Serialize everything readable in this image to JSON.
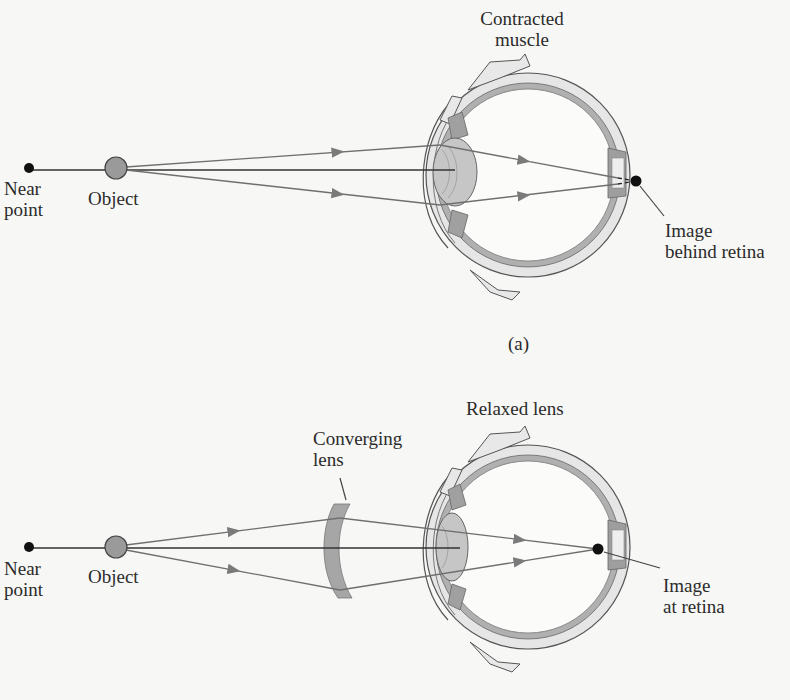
{
  "panel_a": {
    "caption": "(a)",
    "top_label_line1": "Contracted",
    "top_label_line2": "muscle",
    "near_point_line1": "Near",
    "near_point_line2": "point",
    "object_label": "Object",
    "image_label_line1": "Image",
    "image_label_line2": "behind retina"
  },
  "panel_b": {
    "top_label": "Relaxed lens",
    "lens_label_line1": "Converging",
    "lens_label_line2": "lens",
    "near_point_line1": "Near",
    "near_point_line2": "point",
    "object_label": "Object",
    "image_label_line1": "Image",
    "image_label_line2": "at retina"
  },
  "colors": {
    "background": "#f7f7f5",
    "ray": "#6f6f6f",
    "object_fill": "#9a9a9a",
    "eye_wall": "#e2e2e2",
    "choroid": "#a9a9a9",
    "lens": "#c8c8c8",
    "converging_lens": "#a6a6a6",
    "point": "#111111"
  }
}
